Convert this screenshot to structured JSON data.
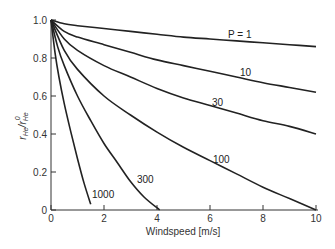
{
  "chart_data": {
    "type": "line",
    "title": "",
    "xlabel": "Windspeed [m/s]",
    "ylabel": "r_He / r_He^0",
    "xlim": [
      0,
      10
    ],
    "ylim": [
      0,
      1.0
    ],
    "grid": false,
    "legend": "inline curve labels",
    "x_ticks": [
      "0",
      "2",
      "4",
      "6",
      "8",
      "10"
    ],
    "y_ticks": [
      "0",
      "0.2",
      "0.4",
      "0.6",
      "0.8",
      "1.0"
    ],
    "series": [
      {
        "name": "P = 1",
        "x": [
          0,
          0.5,
          1,
          2,
          3,
          4,
          5,
          6,
          7,
          8,
          9,
          10
        ],
        "y": [
          1.0,
          0.98,
          0.97,
          0.955,
          0.94,
          0.925,
          0.91,
          0.9,
          0.89,
          0.88,
          0.87,
          0.86
        ]
      },
      {
        "name": "10",
        "x": [
          0,
          0.5,
          1,
          2,
          3,
          4,
          5,
          6,
          7,
          8,
          9,
          10
        ],
        "y": [
          1.0,
          0.94,
          0.91,
          0.87,
          0.83,
          0.79,
          0.76,
          0.73,
          0.7,
          0.67,
          0.645,
          0.62
        ]
      },
      {
        "name": "30",
        "x": [
          0,
          0.5,
          1,
          2,
          3,
          4,
          5,
          6,
          7,
          8,
          9,
          10
        ],
        "y": [
          1.0,
          0.9,
          0.84,
          0.76,
          0.7,
          0.64,
          0.59,
          0.55,
          0.51,
          0.47,
          0.44,
          0.4
        ]
      },
      {
        "name": "100",
        "x": [
          0,
          0.5,
          1,
          2,
          3,
          4,
          5,
          6,
          7,
          8,
          9,
          10
        ],
        "y": [
          1.0,
          0.84,
          0.74,
          0.6,
          0.5,
          0.41,
          0.33,
          0.26,
          0.19,
          0.12,
          0.06,
          0.0
        ]
      },
      {
        "name": "300",
        "x": [
          0,
          0.25,
          0.5,
          1,
          1.5,
          2,
          2.5,
          3,
          3.5,
          4.1
        ],
        "y": [
          1.0,
          0.86,
          0.76,
          0.6,
          0.47,
          0.35,
          0.25,
          0.15,
          0.07,
          0.0
        ]
      },
      {
        "name": "1000",
        "x": [
          0,
          0.15,
          0.3,
          0.5,
          0.75,
          1.0,
          1.25,
          1.5
        ],
        "y": [
          1.0,
          0.83,
          0.7,
          0.56,
          0.41,
          0.27,
          0.14,
          0.03
        ]
      }
    ],
    "annotations": [
      "P = 1",
      "10",
      "30",
      "100",
      "300",
      "1000"
    ]
  },
  "labels": {
    "xlabel": "Windspeed [m/s]",
    "ylabel_main": "r",
    "ylabel_sub": "He",
    "ylabel_sep": "/",
    "ylabel_main2": "r",
    "ylabel_sub2": "He",
    "ylabel_sup2": "0",
    "xticks": [
      "0",
      "2",
      "4",
      "6",
      "8",
      "10"
    ],
    "yticks": [
      "0",
      "0.2",
      "0.4",
      "0.6",
      "0.8",
      "1.0"
    ],
    "curve_labels": [
      "P = 1",
      "10",
      "30",
      "100",
      "300",
      "1000"
    ]
  }
}
